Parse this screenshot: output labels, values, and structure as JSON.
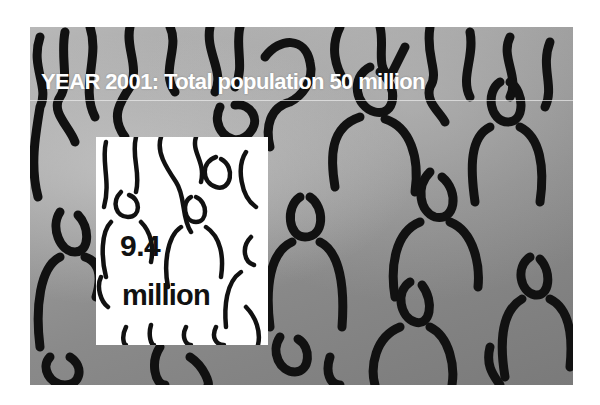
{
  "headline": {
    "title": "YEAR 2001: Total population 50 million"
  },
  "inset": {
    "value": "9.4",
    "unit": "million"
  },
  "colors": {
    "title_text": "#ffffff",
    "outline": "#111111",
    "inset_background": "#ffffff",
    "background_light": "#b8b8b8",
    "background_dark": "#7a7a7a"
  }
}
